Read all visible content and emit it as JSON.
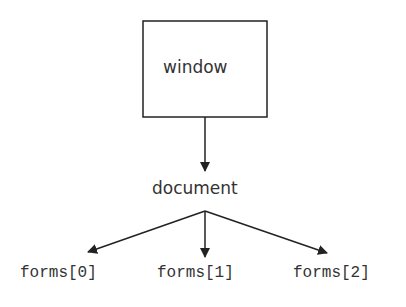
{
  "diagram": {
    "root": {
      "label": "window"
    },
    "child": {
      "label": "document"
    },
    "leaves": [
      {
        "label": "forms[0]"
      },
      {
        "label": "forms[1]"
      },
      {
        "label": "forms[2]"
      }
    ],
    "colors": {
      "stroke": "#222222",
      "text": "#333333",
      "background": "#ffffff"
    }
  }
}
